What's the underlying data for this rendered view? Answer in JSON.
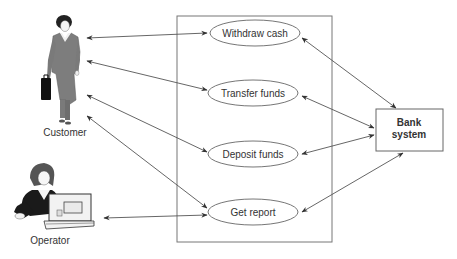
{
  "diagram": {
    "type": "uml-use-case",
    "system_boundary": {
      "x": 177,
      "y": 16,
      "w": 155,
      "h": 226
    },
    "actors": [
      {
        "id": "customer",
        "label": "Customer",
        "label_x": 65,
        "label_y": 133
      },
      {
        "id": "operator",
        "label": "Operator",
        "label_x": 50,
        "label_y": 240
      }
    ],
    "use_cases": [
      {
        "id": "withdraw",
        "label": "Withdraw cash",
        "cx": 255,
        "cy": 33,
        "rx": 45,
        "ry": 13
      },
      {
        "id": "transfer",
        "label": "Transfer funds",
        "cx": 253,
        "cy": 93,
        "rx": 45,
        "ry": 13
      },
      {
        "id": "deposit",
        "label": "Deposit funds",
        "cx": 253,
        "cy": 154,
        "rx": 45,
        "ry": 13
      },
      {
        "id": "report",
        "label": "Get report",
        "cx": 253,
        "cy": 212,
        "rx": 45,
        "ry": 13
      }
    ],
    "external_system": {
      "id": "bank",
      "label_line1": "Bank",
      "label_line2": "system",
      "x": 376,
      "y": 109,
      "w": 67,
      "h": 42
    },
    "associations": [
      {
        "from": "customer",
        "to": "withdraw",
        "x1": 87,
        "y1": 38,
        "x2": 207,
        "y2": 33
      },
      {
        "from": "customer",
        "to": "transfer",
        "x1": 87,
        "y1": 61,
        "x2": 207,
        "y2": 90
      },
      {
        "from": "customer",
        "to": "deposit",
        "x1": 87,
        "y1": 95,
        "x2": 207,
        "y2": 152
      },
      {
        "from": "customer",
        "to": "report",
        "x1": 87,
        "y1": 116,
        "x2": 207,
        "y2": 208
      },
      {
        "from": "operator",
        "to": "report",
        "x1": 104,
        "y1": 218,
        "x2": 207,
        "y2": 215
      },
      {
        "from": "withdraw",
        "to": "bank",
        "x1": 302,
        "y1": 38,
        "x2": 396,
        "y2": 108
      },
      {
        "from": "transfer",
        "to": "bank",
        "x1": 302,
        "y1": 96,
        "x2": 374,
        "y2": 128
      },
      {
        "from": "deposit",
        "to": "bank",
        "x1": 302,
        "y1": 154,
        "x2": 374,
        "y2": 135
      },
      {
        "from": "report",
        "to": "bank",
        "x1": 302,
        "y1": 212,
        "x2": 403,
        "y2": 153
      }
    ]
  },
  "colors": {
    "line": "#555555",
    "text": "#333333",
    "figure_suit": "#7a7a7a",
    "figure_dark": "#1a1a1a"
  }
}
